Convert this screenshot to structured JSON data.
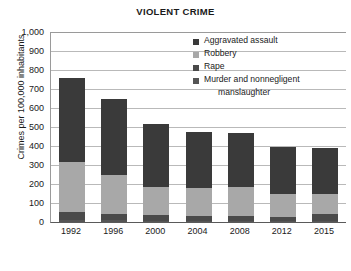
{
  "chart_data": {
    "type": "bar",
    "subtype": "stacked-vertical",
    "title": "VIOLENT CRIME",
    "xlabel": "",
    "ylabel": "Crimes per 100,000 inhabitants",
    "ylim": [
      0,
      1000
    ],
    "ytick_step": 100,
    "yticks": [
      "0",
      "100",
      "200",
      "300",
      "400",
      "500",
      "600",
      "700",
      "800",
      "900",
      "1,000"
    ],
    "grid": "horizontal",
    "legend_position": "inside-top-right",
    "categories": [
      "1992",
      "1996",
      "2000",
      "2004",
      "2008",
      "2012",
      "2015"
    ],
    "series": [
      {
        "name": "Murder and nonnegligent manslaughter",
        "color": "#555555",
        "stack_order": 1,
        "values": [
          12,
          9,
          7,
          6,
          6,
          5,
          6
        ]
      },
      {
        "name": "Rape",
        "color": "#4a4a4a",
        "stack_order": 2,
        "values": [
          43,
          33,
          29,
          28,
          26,
          24,
          34
        ]
      },
      {
        "name": "Robbery",
        "color": "#a8a8a8",
        "stack_order": 3,
        "values": [
          260,
          206,
          148,
          143,
          151,
          118,
          105
        ]
      },
      {
        "name": "Aggravated assault",
        "color": "#3a3a3a",
        "stack_order": 4,
        "values": [
          443,
          400,
          333,
          296,
          284,
          248,
          245
        ]
      }
    ],
    "totals": [
      758,
      648,
      517,
      473,
      467,
      395,
      390
    ]
  },
  "legend": {
    "items": [
      {
        "label": "Aggravated assault",
        "color": "#3a3a3a"
      },
      {
        "label": "Robbery",
        "color": "#a8a8a8"
      },
      {
        "label": "Rape",
        "color": "#4a4a4a"
      },
      {
        "label": "Murder and nonnegligent",
        "label2": "manslaughter",
        "color": "#555555"
      }
    ]
  },
  "colors": {
    "gridline": "#b9b9b9",
    "axis": "#5a5a5a",
    "text": "#1a1a1a",
    "background": "#ffffff"
  }
}
